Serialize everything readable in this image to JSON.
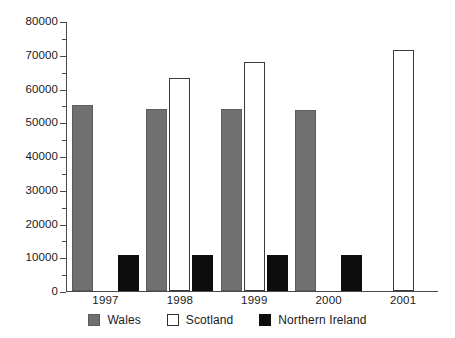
{
  "chart_data": {
    "type": "bar",
    "title": "",
    "subtitle": "",
    "xlabel": "",
    "ylabel": "",
    "categories": [
      "1997",
      "1998",
      "1999",
      "2000",
      "2001"
    ],
    "series": [
      {
        "name": "Wales",
        "color": "#707070",
        "values": [
          55000,
          54000,
          53800,
          53600,
          null
        ]
      },
      {
        "name": "Scotland",
        "color": "#ffffff",
        "values": [
          null,
          63000,
          68000,
          null,
          71500
        ]
      },
      {
        "name": "Northern Ireland",
        "color": "#0d0d0d",
        "values": [
          10700,
          10700,
          10800,
          10700,
          null
        ]
      }
    ],
    "ylim": [
      0,
      80000
    ],
    "ytick_labels": [
      "0",
      "10000",
      "20000",
      "30000",
      "40000",
      "50000",
      "60000",
      "70000",
      "80000"
    ],
    "ytick_values": [
      0,
      10000,
      20000,
      30000,
      40000,
      50000,
      60000,
      70000,
      80000
    ],
    "yminor_tick_values": [
      5000,
      15000,
      25000,
      35000,
      45000,
      55000,
      65000,
      75000
    ],
    "grid": false,
    "legend_position": "bottom",
    "legend_entries": [
      {
        "label": "Wales",
        "swatch": "wales"
      },
      {
        "label": "Scotland",
        "swatch": "scotland"
      },
      {
        "label": "Northern Ireland",
        "swatch": "northern-ireland"
      }
    ]
  },
  "colors": {
    "wales": "#707070",
    "scotland": "#ffffff",
    "scotland_border": "#3a3a3a",
    "northern_ireland": "#0d0d0d",
    "axis": "#4a4a4a",
    "text": "#1a1a1a",
    "background": "#ffffff"
  }
}
